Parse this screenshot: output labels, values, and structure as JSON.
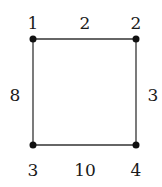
{
  "graph": {
    "nodes": [
      {
        "id": "1",
        "label": "1",
        "x": 33,
        "y": 39
      },
      {
        "id": "2",
        "label": "2",
        "x": 136,
        "y": 39
      },
      {
        "id": "3",
        "label": "3",
        "x": 33,
        "y": 145
      },
      {
        "id": "4",
        "label": "4",
        "x": 136,
        "y": 145
      }
    ],
    "edges": [
      {
        "from": "1",
        "to": "2",
        "weight": "2"
      },
      {
        "from": "1",
        "to": "3",
        "weight": "8"
      },
      {
        "from": "2",
        "to": "4",
        "weight": "3"
      },
      {
        "from": "3",
        "to": "4",
        "weight": "10"
      }
    ]
  },
  "colors": {
    "line": "#333333",
    "node": "#111111",
    "text": "#1a1a1a"
  }
}
